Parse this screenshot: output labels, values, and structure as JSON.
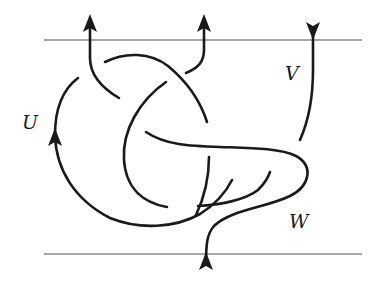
{
  "diagram": {
    "type": "tangle-diagram",
    "boundaries": {
      "top": {
        "y": 40,
        "x_start": 44,
        "x_end": 362
      },
      "bottom": {
        "y": 254,
        "x_start": 44,
        "x_end": 362
      }
    },
    "labels": {
      "u": "U",
      "v": "V",
      "w": "W"
    },
    "strand_color": "#1a1a1a",
    "boundary_color": "#8a8a8a",
    "arrows": [
      {
        "name": "left-top-arrow",
        "direction": "up",
        "x": 90,
        "y": 14
      },
      {
        "name": "middle-top-arrow",
        "direction": "up",
        "x": 204,
        "y": 14
      },
      {
        "name": "right-top-arrow",
        "direction": "down",
        "x": 313,
        "y": 30
      },
      {
        "name": "u-arrow",
        "direction": "up",
        "x": 55,
        "y": 132
      },
      {
        "name": "bottom-arrow",
        "direction": "up",
        "x": 206,
        "y": 254
      }
    ]
  }
}
